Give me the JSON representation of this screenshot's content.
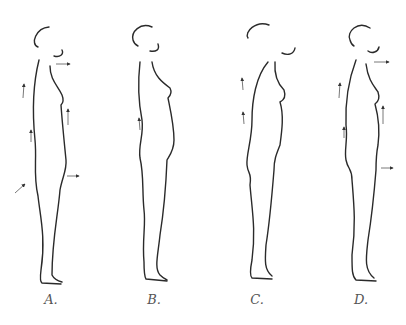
{
  "diagram": {
    "type": "posture comparison, side-view outlines with correction arrows",
    "figures": [
      {
        "id": "A",
        "label": "A.",
        "arrows": [
          "chin forward",
          "upper back up",
          "chest up",
          "lower back up",
          "pelvis forward-up",
          "hips forward"
        ]
      },
      {
        "id": "B",
        "label": "B.",
        "arrows": [
          "lower back up"
        ]
      },
      {
        "id": "C",
        "label": "C.",
        "arrows": [
          "upper back up",
          "lower back up"
        ]
      },
      {
        "id": "D",
        "label": "D.",
        "arrows": [
          "chin forward",
          "upper back up",
          "chest up",
          "lower back up",
          "hips forward"
        ]
      }
    ],
    "colors": {
      "outline": "#2a2a2a",
      "arrow": "#555555",
      "label": "#555555"
    }
  }
}
